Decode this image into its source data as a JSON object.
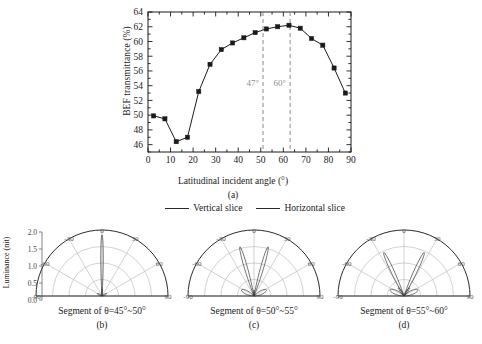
{
  "figure": {
    "panel_a_label": "(a)",
    "panel_b_label": "(b)",
    "panel_c_label": "(c)",
    "panel_d_label": "(d)"
  },
  "legend": {
    "vertical": "Vertical slice",
    "horizontal": "Horizontal slice"
  },
  "polar": {
    "axis_title": "Luminance (nit)",
    "radial_ticks": [
      "0.0",
      "0.5",
      "1.0",
      "1.5",
      "2.0"
    ],
    "angle_ticks": [
      "-90",
      "-60",
      "-30",
      "0",
      "30",
      "60",
      "90"
    ],
    "panels": [
      {
        "caption": "Segment of θ=45°~50°",
        "sub": "(b)"
      },
      {
        "caption": "Segment of θ=50°~55°",
        "sub": "(c)"
      },
      {
        "caption": "Segment of θ=55°~60°",
        "sub": "(d)"
      }
    ]
  },
  "chart_data": [
    {
      "type": "line",
      "panel": "(a)",
      "title": "",
      "xlabel": "Latitudinal incident angle (°)",
      "ylabel": "BEF transmittance (%)",
      "xlim": [
        0,
        90
      ],
      "ylim": [
        45,
        64
      ],
      "xticks": [
        0,
        10,
        20,
        30,
        40,
        50,
        60,
        70,
        80,
        90
      ],
      "yticks": [
        46,
        48,
        50,
        52,
        54,
        56,
        58,
        60,
        62,
        64
      ],
      "grid": false,
      "marker": "filled-square",
      "line_color": "#1a1a1a",
      "x": [
        2.5,
        7.5,
        12.5,
        17.5,
        22.5,
        27.5,
        32.5,
        37.5,
        42.5,
        47.5,
        52.5,
        57.5,
        62.5,
        67.5,
        72.5,
        77.5,
        82.5,
        87.5
      ],
      "y": [
        49.9,
        49.5,
        46.4,
        47.0,
        53.2,
        56.9,
        58.9,
        59.8,
        60.5,
        61.2,
        61.7,
        62.0,
        62.2,
        61.8,
        60.4,
        59.5,
        56.4,
        53.0
      ],
      "annotations": [
        {
          "label": "47°",
          "x": 51,
          "style": "dashed-vertical",
          "color": "#8c8c8c"
        },
        {
          "label": "60°",
          "x": 63,
          "style": "dashed-vertical",
          "color": "#8c8c8c"
        }
      ]
    },
    {
      "type": "line",
      "panel": "(b)",
      "coordinate_system": "polar-half",
      "title": "Segment of θ=45°~50°",
      "rlabel": "Luminance (nit)",
      "rlim": [
        0.0,
        2.0
      ],
      "rticks": [
        0.0,
        0.5,
        1.0,
        1.5,
        2.0
      ],
      "angle_range": [
        -90,
        90
      ],
      "angle_ticks": [
        -90,
        -60,
        -30,
        0,
        30,
        60,
        90
      ],
      "series": [
        {
          "name": "Vertical slice",
          "peaks": [
            {
              "angle": 0,
              "r": 1.85,
              "width": 4
            }
          ]
        },
        {
          "name": "Horizontal slice",
          "peaks": [
            {
              "angle": -62,
              "r": 0.16,
              "width": 22
            },
            {
              "angle": 62,
              "r": 0.16,
              "width": 22
            },
            {
              "angle": 0,
              "r": 0.22,
              "width": 10
            }
          ]
        }
      ]
    },
    {
      "type": "line",
      "panel": "(c)",
      "coordinate_system": "polar-half",
      "title": "Segment of θ=50°~55°",
      "rlabel": "Luminance (nit)",
      "rlim": [
        0.0,
        2.0
      ],
      "rticks": [
        0.0,
        0.5,
        1.0,
        1.5,
        2.0
      ],
      "angle_range": [
        -90,
        90
      ],
      "angle_ticks": [
        -90,
        -60,
        -30,
        0,
        30,
        60,
        90
      ],
      "series": [
        {
          "name": "Vertical slice",
          "peaks": [
            {
              "angle": -16,
              "r": 1.55,
              "width": 6
            },
            {
              "angle": 16,
              "r": 1.55,
              "width": 6
            }
          ]
        },
        {
          "name": "Horizontal slice",
          "peaks": [
            {
              "angle": -64,
              "r": 0.42,
              "width": 26
            },
            {
              "angle": 64,
              "r": 0.42,
              "width": 26
            },
            {
              "angle": 0,
              "r": 0.18,
              "width": 10
            }
          ]
        }
      ]
    },
    {
      "type": "line",
      "panel": "(d)",
      "coordinate_system": "polar-half",
      "title": "Segment of θ=55°~60°",
      "rlabel": "Luminance (nit)",
      "rlim": [
        0.0,
        2.0
      ],
      "rticks": [
        0.0,
        0.5,
        1.0,
        1.5,
        2.0
      ],
      "angle_range": [
        -90,
        90
      ],
      "angle_ticks": [
        -90,
        -60,
        -30,
        0,
        30,
        60,
        90
      ],
      "series": [
        {
          "name": "Vertical slice",
          "peaks": [
            {
              "angle": -25,
              "r": 1.45,
              "width": 7
            },
            {
              "angle": 25,
              "r": 1.45,
              "width": 7
            }
          ]
        },
        {
          "name": "Horizontal slice",
          "peaks": [
            {
              "angle": -66,
              "r": 0.46,
              "width": 26
            },
            {
              "angle": 66,
              "r": 0.46,
              "width": 26
            },
            {
              "angle": -34,
              "r": 0.3,
              "width": 16
            },
            {
              "angle": 34,
              "r": 0.3,
              "width": 16
            }
          ]
        }
      ]
    }
  ]
}
